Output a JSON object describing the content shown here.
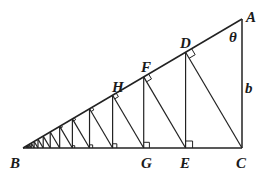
{
  "diagram": {
    "type": "geometry",
    "points": {
      "A": {
        "label": "A",
        "x": 242,
        "y": 19
      },
      "B": {
        "label": "B",
        "x": 23,
        "y": 148
      },
      "C": {
        "label": "C",
        "x": 242,
        "y": 148
      },
      "D": {
        "label": "D"
      },
      "E": {
        "label": "E"
      },
      "F": {
        "label": "F"
      },
      "G": {
        "label": "G"
      },
      "H": {
        "label": "H"
      }
    },
    "angle_label": "θ",
    "side_label": "b",
    "ratio": 0.7423,
    "iterations": 14
  }
}
